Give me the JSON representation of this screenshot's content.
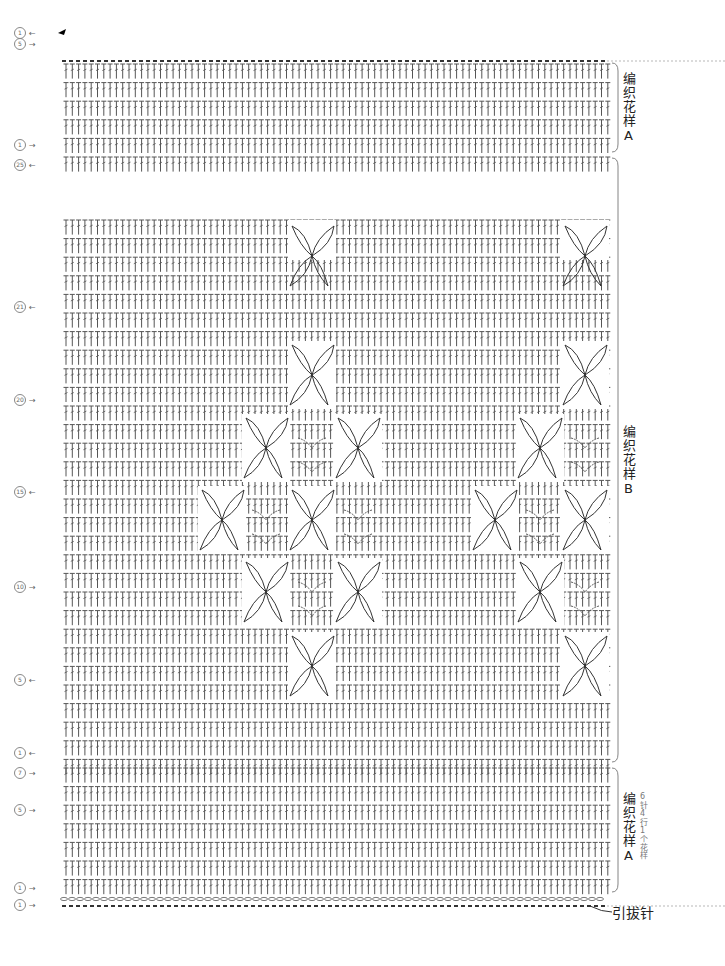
{
  "diagram": {
    "type": "crochet-chart",
    "sections": [
      {
        "id": "top",
        "label": "编织花样A",
        "y_start": 60,
        "y_end": 150
      },
      {
        "id": "middle",
        "label": "编织花样B",
        "y_start": 158,
        "y_end": 762
      },
      {
        "id": "bottom",
        "label": "编织花样A",
        "note": "6针4行1个花样",
        "y_start": 768,
        "y_end": 892
      }
    ],
    "row_markers": [
      {
        "label": "1",
        "dir": "←",
        "y": 33
      },
      {
        "label": "5",
        "dir": "→",
        "y": 44
      },
      {
        "label": "1",
        "dir": "→",
        "y": 145
      },
      {
        "label": "25",
        "dir": "←",
        "y": 165
      },
      {
        "label": "21",
        "dir": "←",
        "y": 307
      },
      {
        "label": "20",
        "dir": "→",
        "y": 400
      },
      {
        "label": "15",
        "dir": "←",
        "y": 492
      },
      {
        "label": "10",
        "dir": "→",
        "y": 587
      },
      {
        "label": "5",
        "dir": "←",
        "y": 680
      },
      {
        "label": "1",
        "dir": "←",
        "y": 753
      },
      {
        "label": "7",
        "dir": "→",
        "y": 773
      },
      {
        "label": "5",
        "dir": "→",
        "y": 810
      },
      {
        "label": "1",
        "dir": "→",
        "y": 888
      },
      {
        "label": "1",
        "dir": "→",
        "y": 905
      }
    ],
    "slip_stitch_label": "引拔针",
    "colors": {
      "stitch": "#555555",
      "motif": "#333333",
      "dashed": "#999999"
    }
  }
}
